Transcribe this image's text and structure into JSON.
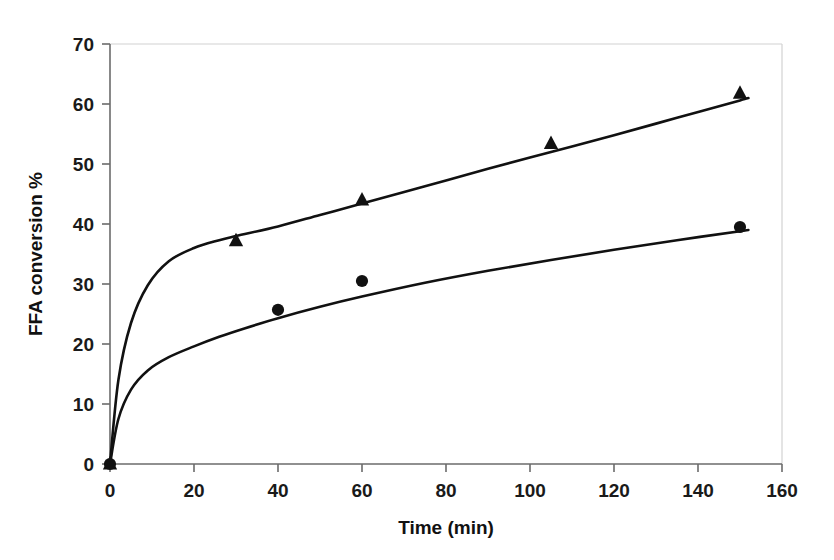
{
  "chart_data": {
    "type": "line",
    "title": "",
    "subtitle": "",
    "xlabel": "Time (min)",
    "ylabel": "FFA conversion %",
    "xlim": [
      0,
      160
    ],
    "ylim": [
      0,
      70
    ],
    "xticks": [
      0,
      20,
      40,
      60,
      80,
      100,
      120,
      140,
      160
    ],
    "yticks": [
      0,
      10,
      20,
      30,
      40,
      50,
      60,
      70
    ],
    "grid": false,
    "legend": "none",
    "series": [
      {
        "name": "Upper series (triangles)",
        "marker": "triangle",
        "color": "#111111",
        "points": [
          {
            "x": 0,
            "y": 0
          },
          {
            "x": 30,
            "y": 37.2
          },
          {
            "x": 60,
            "y": 44.0
          },
          {
            "x": 105,
            "y": 53.4
          },
          {
            "x": 150,
            "y": 61.8
          }
        ],
        "fit_curve": [
          {
            "x": 0,
            "y": 0
          },
          {
            "x": 2,
            "y": 14.0
          },
          {
            "x": 5,
            "y": 23.5
          },
          {
            "x": 9,
            "y": 29.8
          },
          {
            "x": 14,
            "y": 33.8
          },
          {
            "x": 20,
            "y": 36.0
          },
          {
            "x": 26,
            "y": 37.3
          },
          {
            "x": 30,
            "y": 38.0
          },
          {
            "x": 40,
            "y": 39.6
          },
          {
            "x": 50,
            "y": 41.5
          },
          {
            "x": 60,
            "y": 43.4
          },
          {
            "x": 75,
            "y": 46.3
          },
          {
            "x": 90,
            "y": 49.2
          },
          {
            "x": 105,
            "y": 52.0
          },
          {
            "x": 120,
            "y": 54.8
          },
          {
            "x": 135,
            "y": 57.7
          },
          {
            "x": 150,
            "y": 60.6
          },
          {
            "x": 152,
            "y": 61.0
          }
        ]
      },
      {
        "name": "Lower series (circles)",
        "marker": "circle",
        "color": "#111111",
        "points": [
          {
            "x": 0,
            "y": 0
          },
          {
            "x": 40,
            "y": 25.7
          },
          {
            "x": 60,
            "y": 30.5
          },
          {
            "x": 150,
            "y": 39.5
          }
        ],
        "fit_curve": [
          {
            "x": 0,
            "y": 0
          },
          {
            "x": 2,
            "y": 7.5
          },
          {
            "x": 5,
            "y": 12.4
          },
          {
            "x": 9,
            "y": 15.6
          },
          {
            "x": 14,
            "y": 17.8
          },
          {
            "x": 20,
            "y": 19.6
          },
          {
            "x": 26,
            "y": 21.2
          },
          {
            "x": 32,
            "y": 22.6
          },
          {
            "x": 40,
            "y": 24.3
          },
          {
            "x": 50,
            "y": 26.2
          },
          {
            "x": 60,
            "y": 27.9
          },
          {
            "x": 75,
            "y": 30.2
          },
          {
            "x": 90,
            "y": 32.2
          },
          {
            "x": 105,
            "y": 34.0
          },
          {
            "x": 120,
            "y": 35.7
          },
          {
            "x": 135,
            "y": 37.3
          },
          {
            "x": 150,
            "y": 38.8
          },
          {
            "x": 152,
            "y": 39.0
          }
        ]
      }
    ]
  },
  "axes": {
    "x_tick_labels": [
      "0",
      "20",
      "40",
      "60",
      "80",
      "100",
      "120",
      "140",
      "160"
    ],
    "y_tick_labels": [
      "0",
      "10",
      "20",
      "30",
      "40",
      "50",
      "60",
      "70"
    ],
    "x_axis_title": "Time (min)",
    "y_axis_title": "FFA conversion %"
  }
}
